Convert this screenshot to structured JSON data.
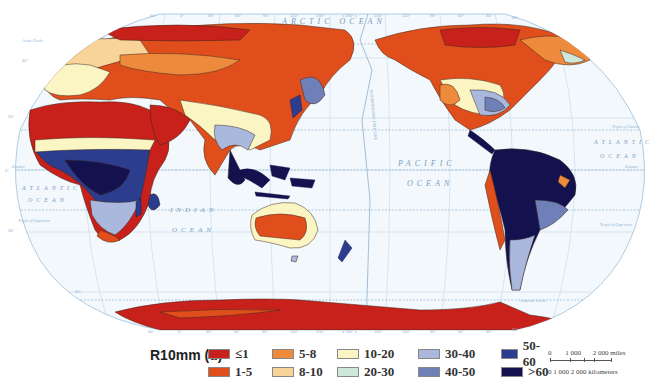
{
  "map": {
    "projection_type": "world",
    "ocean_labels": {
      "arctic": "ARCTIC OCEAN",
      "pacific_1": "PACIFIC",
      "pacific_2": "OCEAN",
      "atlantic_w_1": "ATLANTIC",
      "atlantic_w_2": "OCEAN",
      "atlantic_e_1": "ATLANTIC",
      "atlantic_e_2": "OCEAN",
      "indian_1": "INDIAN",
      "indian_2": "OCEAN"
    },
    "date_line_label": "INTERNATIONAL DATE LINE",
    "lat_labels": {
      "arctic_circle": "Arctic Circle",
      "tropic_cancer": "Tropic of Cancer",
      "equator": "Equator",
      "tropic_capricorn": "Tropic of Capricorn",
      "antarctic_circle": "Antarctic Circle"
    },
    "lon_ticks_top": [
      "60°",
      "0°",
      "30°",
      "60°",
      "90°",
      "120°",
      "150°",
      "± 180° ±",
      "150°",
      "120°",
      "90°",
      "60°",
      "30°",
      "60°"
    ],
    "lon_ticks_bottom": [
      "60°",
      "0°",
      "30°",
      "60°",
      "90°",
      "120°",
      "150°",
      "± 180° ±",
      "150°",
      "120°",
      "90°",
      "60°",
      "30°",
      "60°"
    ],
    "lat_ticks": [
      "60°",
      "30°",
      "0°",
      "30°",
      "60°"
    ]
  },
  "legend": {
    "title": "R10mm (d)",
    "items": [
      {
        "label": "≤1",
        "color": "#c8201a"
      },
      {
        "label": "1-5",
        "color": "#e04e1c"
      },
      {
        "label": "5-8",
        "color": "#ee8a3c"
      },
      {
        "label": "8-10",
        "color": "#f8d49a"
      },
      {
        "label": "10-20",
        "color": "#fbf5c4"
      },
      {
        "label": "20-30",
        "color": "#cfe8dc"
      },
      {
        "label": "30-40",
        "color": "#aab8de"
      },
      {
        "label": "40-50",
        "color": "#6f7fb8"
      },
      {
        "label": "50-60",
        "color": "#2c3d8e"
      },
      {
        "label": ">60",
        "color": "#14124e"
      }
    ]
  },
  "scale": {
    "miles_labels": [
      "0",
      "1 000",
      "2 000 miles"
    ],
    "km_labels": "0   1 000 2 000 kilometers"
  }
}
